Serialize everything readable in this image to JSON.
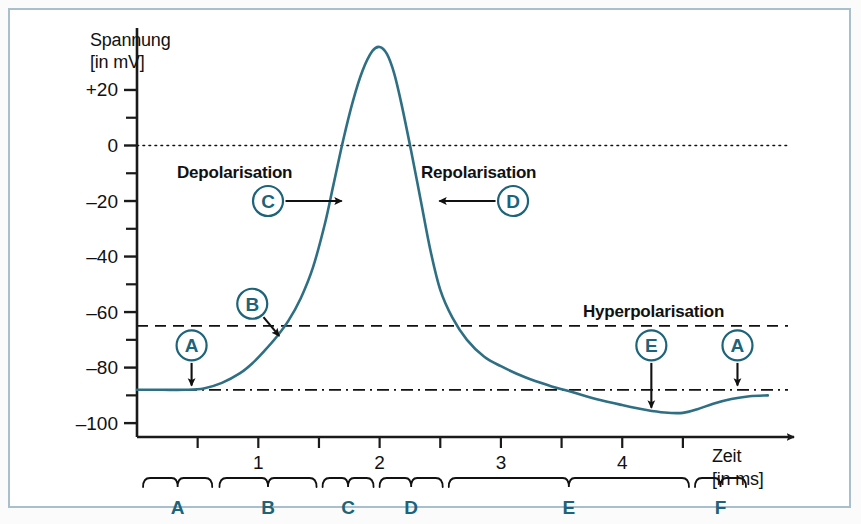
{
  "figure": {
    "background_color": "#ffffff",
    "frame_color": "#a9bfcd",
    "curve_color": "#2e6f84",
    "accent_color": "#1d6379",
    "axis_color": "#1a1a1a"
  },
  "axes": {
    "y_title_line1": "Spannung",
    "y_title_line2": "[in mV]",
    "x_title_line1": "Zeit",
    "x_title_line2": "[in ms]",
    "y_ticks": [
      "+20",
      "0",
      "–20",
      "–40",
      "–60",
      "–80",
      "–100"
    ],
    "y_tick_values": [
      20,
      0,
      -20,
      -40,
      -60,
      -80,
      -100
    ],
    "y_minor_values": [
      10,
      -10,
      -30,
      -50,
      -70,
      -90
    ],
    "x_ticks": [
      "1",
      "2",
      "3",
      "4"
    ],
    "x_tick_values": [
      1,
      2,
      3,
      4
    ],
    "x_minor_values": [
      0.5,
      1.5,
      2.5,
      3.5,
      4.5
    ],
    "ylim": [
      -105,
      38
    ],
    "xlim": [
      0,
      5.35
    ]
  },
  "reference_lines": [
    {
      "name": "zero-line",
      "value": 0,
      "style": "dotted",
      "label": ""
    },
    {
      "name": "threshold-line",
      "value": -65,
      "style": "dashed",
      "label": ""
    },
    {
      "name": "resting-line",
      "value": -88,
      "style": "dash-dot",
      "label": ""
    }
  ],
  "annotations": [
    {
      "id": "A1",
      "marker": "A",
      "text": "",
      "marker_x": 0.45,
      "marker_y": -72,
      "tip_x": 0.45,
      "tip_y": -87,
      "dir": "down"
    },
    {
      "id": "B",
      "marker": "B",
      "text": "",
      "marker_x": 0.95,
      "marker_y": -57,
      "tip_x": 1.18,
      "tip_y": -69,
      "dir": "down-right"
    },
    {
      "id": "C",
      "marker": "C",
      "text": "Depolarisation",
      "marker_x": 1.08,
      "marker_y": -20,
      "tip_x": 1.7,
      "tip_y": -20,
      "dir": "right"
    },
    {
      "id": "D",
      "marker": "D",
      "text": "Repolarisation",
      "marker_x": 3.1,
      "marker_y": -20,
      "tip_x": 2.48,
      "tip_y": -20,
      "dir": "left"
    },
    {
      "id": "E",
      "marker": "E",
      "text": "Hyperpolarisation",
      "marker_x": 4.24,
      "marker_y": -72,
      "tip_x": 4.24,
      "tip_y": -95,
      "dir": "down"
    },
    {
      "id": "A2",
      "marker": "A",
      "text": "",
      "marker_x": 4.95,
      "marker_y": -72,
      "tip_x": 4.95,
      "tip_y": -87,
      "dir": "down"
    }
  ],
  "hyperpolarisation_label": "Hyperpolarisation",
  "phases": [
    {
      "label": "A",
      "start": 0.05,
      "end": 0.62
    },
    {
      "label": "B",
      "start": 0.68,
      "end": 1.48
    },
    {
      "label": "C",
      "start": 1.53,
      "end": 1.95
    },
    {
      "label": "D",
      "start": 2.0,
      "end": 2.52
    },
    {
      "label": "E",
      "start": 2.57,
      "end": 4.55
    },
    {
      "label": "F",
      "start": 4.6,
      "end": 5.02
    }
  ],
  "chart_data": {
    "type": "line",
    "title": "",
    "xlabel": "Zeit [in ms]",
    "ylabel": "Spannung [in mV]",
    "xlim": [
      0,
      5.35
    ],
    "ylim": [
      -105,
      38
    ],
    "grid": false,
    "legend": null,
    "series": [
      {
        "name": "Aktionspotential",
        "x": [
          0.0,
          0.2,
          0.4,
          0.55,
          0.7,
          0.85,
          0.95,
          1.05,
          1.15,
          1.25,
          1.35,
          1.45,
          1.55,
          1.62,
          1.7,
          1.78,
          1.86,
          1.94,
          2.0,
          2.06,
          2.12,
          2.18,
          2.26,
          2.34,
          2.42,
          2.5,
          2.6,
          2.72,
          2.86,
          3.0,
          3.2,
          3.4,
          3.6,
          3.8,
          4.0,
          4.2,
          4.35,
          4.5,
          4.62,
          4.75,
          4.9,
          5.05,
          5.2
        ],
        "y": [
          -88.0,
          -88.0,
          -88.0,
          -87.5,
          -85.5,
          -82.0,
          -78.5,
          -74.0,
          -69.0,
          -63.0,
          -55.0,
          -44.0,
          -28.0,
          -14.0,
          2.0,
          16.0,
          27.0,
          34.0,
          35.5,
          33.0,
          26.0,
          15.0,
          -2.0,
          -20.0,
          -38.0,
          -52.0,
          -62.0,
          -70.0,
          -76.0,
          -79.5,
          -83.5,
          -86.5,
          -89.0,
          -91.5,
          -93.5,
          -95.3,
          -96.2,
          -96.3,
          -95.0,
          -93.0,
          -91.3,
          -90.3,
          -90.0
        ]
      }
    ],
    "reference_lines": [
      {
        "name": "zero",
        "y": 0,
        "style": "dotted"
      },
      {
        "name": "threshold",
        "y": -65,
        "style": "dashed"
      },
      {
        "name": "resting",
        "y": -88,
        "style": "dash-dot"
      }
    ]
  }
}
